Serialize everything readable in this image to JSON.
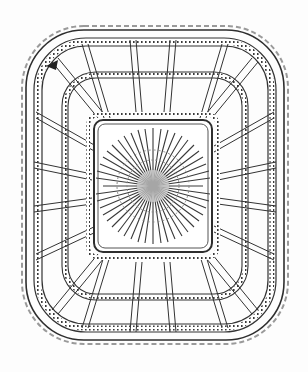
{
  "image": {
    "subject": "Pressed glass dish with lattice pattern and central starburst",
    "alt": "Line illustration of a square scalloped-edge pressed glass dish with beaded lattice panels and a sunburst center",
    "colors": {
      "background": "#fdfdfd",
      "ink": "#2a2a2a",
      "mid": "#6b6b6b",
      "light": "#bdbdbd"
    }
  }
}
